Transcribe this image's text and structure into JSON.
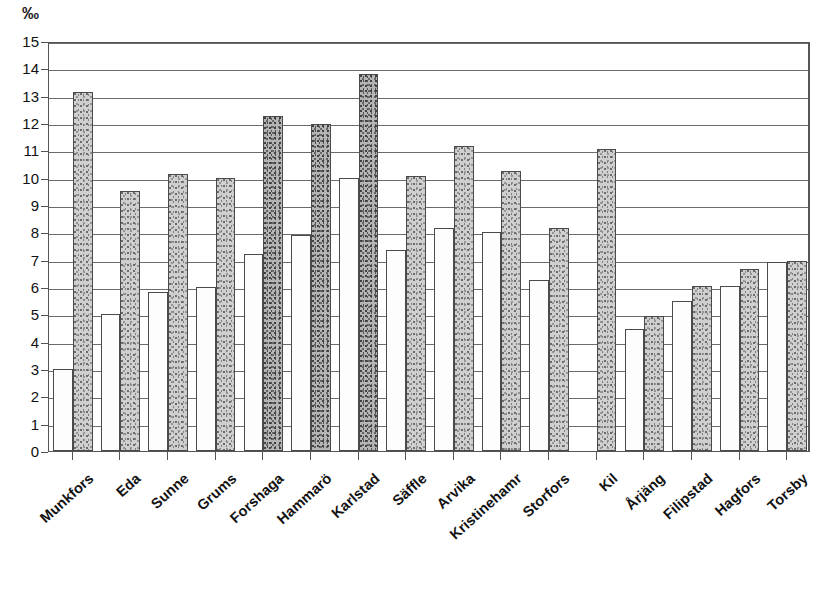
{
  "chart_data": {
    "type": "bar",
    "title": "",
    "subtitle": "",
    "unit_label": "‰",
    "xlabel": "",
    "ylabel": "",
    "ylim": [
      0,
      15
    ],
    "y_ticks": [
      0,
      1,
      2,
      3,
      4,
      5,
      6,
      7,
      8,
      9,
      10,
      11,
      12,
      13,
      14,
      15
    ],
    "y_tick_labels": [
      "0",
      "1",
      "2",
      "3",
      "4",
      "5",
      "6",
      "7",
      "8",
      "9",
      "10",
      "11",
      "12",
      "13",
      "14",
      "15"
    ],
    "grid": true,
    "grid_axis": "y",
    "legend": "none",
    "orientation": "vertical",
    "grouping": "grouped",
    "categories": [
      "Munkfors",
      "Eda",
      "Sunne",
      "Grums",
      "Forshaga",
      "Hammarö",
      "Karlstad",
      "Säffle",
      "Arvika",
      "Kristinehamr",
      "Storfors",
      "Kil",
      "Årjäng",
      "Filipstad",
      "Hagfors",
      "Torsby"
    ],
    "series": [
      {
        "name": "series-a",
        "style": "white",
        "values": [
          3.0,
          5.0,
          5.8,
          6.0,
          7.2,
          7.9,
          10.0,
          7.35,
          8.15,
          8.0,
          6.25,
          0,
          4.45,
          5.5,
          6.05,
          6.9
        ]
      },
      {
        "name": "series-b",
        "style": "shaded",
        "values": [
          13.15,
          9.5,
          10.15,
          10.0,
          12.25,
          11.95,
          13.8,
          10.05,
          11.15,
          10.25,
          8.15,
          11.05,
          4.95,
          6.05,
          6.65,
          6.95
        ]
      }
    ],
    "dark_shaded_categories": [
      "Forshaga",
      "Hammarö",
      "Karlstad"
    ],
    "colors": {
      "series_a_fill": "#fdfdfd",
      "series_b_fill": "#cfcfcf",
      "series_b_dark_fill": "#b4b4b4",
      "bar_outline": "#4a4a4a",
      "grid": "#6b6b6b",
      "axis": "#555555",
      "text": "#111111",
      "background": "#ffffff"
    }
  }
}
